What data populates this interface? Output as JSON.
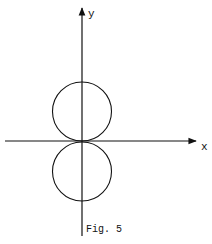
{
  "figure": {
    "caption": "Fig. 5",
    "x_axis_label": "x",
    "y_axis_label": "y",
    "stroke_color": "#111111",
    "background_color": "#ffffff"
  }
}
